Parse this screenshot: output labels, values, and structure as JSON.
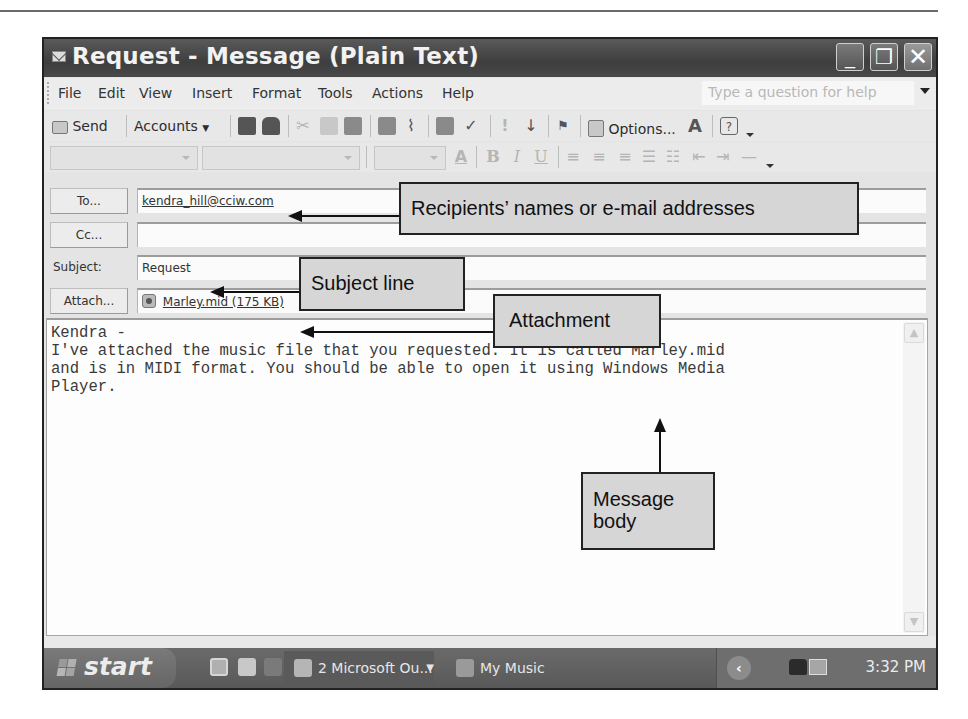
{
  "window": {
    "title": "Request - Message (Plain Text)",
    "controls": {
      "minimize": "_",
      "restore": "❐",
      "close": "✕"
    }
  },
  "menu": {
    "items": [
      "File",
      "Edit",
      "View",
      "Insert",
      "Format",
      "Tools",
      "Actions",
      "Help"
    ],
    "help_placeholder": "Type a question for help"
  },
  "toolbar": {
    "send_label": "Send",
    "accounts_label": "Accounts",
    "options_label": "Options...",
    "icons": [
      "send-icon",
      "save-icon",
      "print-icon",
      "cut-icon",
      "copy-icon",
      "paste-icon",
      "insert-file-icon",
      "attach-paperclip-icon",
      "address-book-icon",
      "check-names-icon",
      "high-importance-icon",
      "low-importance-icon",
      "flag-icon",
      "options-icon",
      "font-icon",
      "help-icon"
    ]
  },
  "format_toolbar": {
    "font_name": "",
    "font_size": "",
    "bold": "B",
    "italic": "I",
    "underline": "U",
    "icons": [
      "font-color-icon",
      "bold-icon",
      "italic-icon",
      "underline-icon",
      "align-left-icon",
      "align-center-icon",
      "align-right-icon",
      "bullets-icon",
      "numbering-icon",
      "decrease-indent-icon",
      "increase-indent-icon",
      "horizontal-line-icon"
    ]
  },
  "header": {
    "to_button": "To...",
    "to_value": "kendra_hill@cciw.com",
    "cc_button": "Cc...",
    "cc_value": "",
    "subject_label": "Subject:",
    "subject_value": "Request",
    "attach_button": "Attach...",
    "attachment": "Marley.mid (175 KB)"
  },
  "body": {
    "text": "Kendra -\nI've attached the music file that you requested. It is called Marley.mid\nand is in MIDI format. You should be able to open it using Windows Media\nPlayer."
  },
  "taskbar": {
    "start_label": "start",
    "tasks": [
      {
        "label": "2 Microsoft Ou...",
        "active": true
      },
      {
        "label": "My Music",
        "active": false
      }
    ],
    "clock": "3:32 PM"
  },
  "callouts": {
    "recipients": "Recipients’ names or e-mail addresses",
    "subject": "Subject line",
    "attachment": "Attachment",
    "message_body": "Message body"
  },
  "colors": {
    "title_bar": "#484848",
    "window_bg": "#e4e4e4",
    "callout_bg": "#d6d6d6",
    "taskbar": "#616161"
  }
}
